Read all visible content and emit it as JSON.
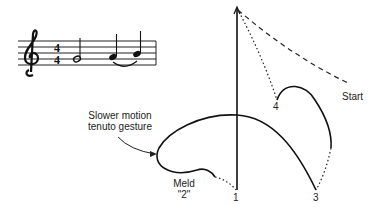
{
  "notation": {
    "clef": "treble-clef",
    "time_signature": {
      "top": "4",
      "bottom": "4"
    },
    "notes": [
      "half-note",
      "quarter-note",
      "quarter-note"
    ],
    "slur": "slur-between-quarter-notes"
  },
  "diagram": {
    "beat_labels": {
      "one": "1",
      "three": "3",
      "four": "4"
    },
    "start_label": "Start",
    "annotation_line1": "Slower motion",
    "annotation_line2": "tenuto gesture",
    "meld_label": "Meld",
    "meld_number": "\"2\""
  }
}
